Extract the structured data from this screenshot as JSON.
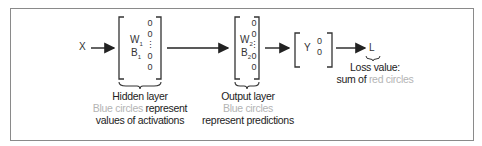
{
  "diagram": {
    "input": {
      "label": "X"
    },
    "hidden_layer": {
      "weight_label": "W",
      "weight_sub": "1",
      "bias_label": "B",
      "bias_sub": "1",
      "circles": [
        "0",
        "0",
        "0",
        "0"
      ],
      "ellipsis": "⋮",
      "title": "Hidden layer",
      "desc_colored": "Blue circles",
      "desc_rest_line1": " represent",
      "desc_line2": "values of activations"
    },
    "output_layer": {
      "weight_label": "W",
      "weight_sub": "2",
      "bias_label": "B",
      "bias_sub": "2",
      "circles": [
        "0",
        "0",
        "0",
        "0"
      ],
      "ellipsis": "⋮",
      "title": "Output layer",
      "desc_colored": "Blue circles",
      "desc_line2": "represent predictions"
    },
    "target": {
      "label": "Y",
      "circles": [
        "0",
        "0"
      ]
    },
    "loss": {
      "label": "L",
      "title": "Loss value:",
      "desc_prefix": "sum of ",
      "desc_colored": "red circles"
    },
    "colors": {
      "border": "#8a8a8a",
      "bracket": "#333333",
      "muted": "#b4b4b4",
      "text": "#222222"
    }
  }
}
